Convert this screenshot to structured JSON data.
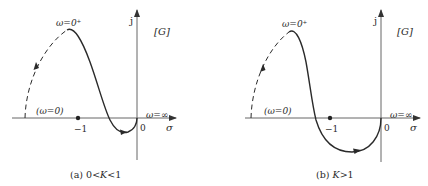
{
  "panels": [
    {
      "id": "a",
      "caption": "(a) 0<K<1",
      "caption_prefix": "(a) 0<",
      "caption_var": "K",
      "caption_suffix": "<1",
      "imag_axis_label": "j",
      "plane_label": "[G]",
      "real_axis_label": "σ",
      "origin_label": "0",
      "minus_one_label": "−1",
      "omega_zero_plus_label": "ω=0⁺",
      "omega_zero_label": "(ω=0)",
      "omega_inf_label": "ω=∞"
    },
    {
      "id": "b",
      "caption": "(b) K>1",
      "caption_prefix": "(b) ",
      "caption_var": "K",
      "caption_suffix": ">1",
      "imag_axis_label": "j",
      "plane_label": "[G]",
      "real_axis_label": "σ",
      "origin_label": "0",
      "minus_one_label": "−1",
      "omega_zero_plus_label": "ω=0⁺",
      "omega_zero_label": "(ω=0)",
      "omega_inf_label": "ω=∞"
    }
  ],
  "colors": {
    "curve": "#2a2a2a",
    "axis": "#555555",
    "text": "#2a2a2a"
  }
}
